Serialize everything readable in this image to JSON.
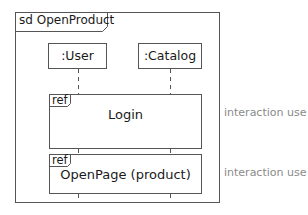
{
  "diagram": {
    "type": "UML sequence diagram",
    "frame": {
      "keyword": "sd",
      "name": "OpenProduct",
      "title": "sd OpenProduct"
    },
    "lifelines": [
      {
        "id": "user",
        "label": ":User"
      },
      {
        "id": "catalog",
        "label": ":Catalog"
      }
    ],
    "fragments": [
      {
        "operator": "ref",
        "name": "Login",
        "annotation": "interaction use"
      },
      {
        "operator": "ref",
        "name": "OpenPage (product)",
        "annotation": "interaction use"
      }
    ],
    "colors": {
      "line": "#555555",
      "text": "#1a1a1a",
      "annotation": "#8a8a8a"
    }
  }
}
